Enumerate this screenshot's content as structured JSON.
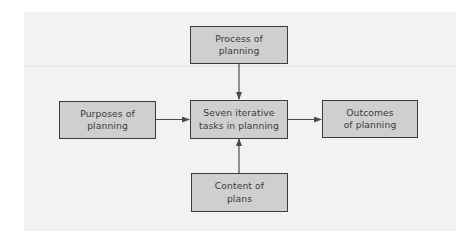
{
  "diagram": {
    "type": "flow",
    "nodes": [
      {
        "id": "process",
        "label": "Process of\nplanning"
      },
      {
        "id": "purposes",
        "label": "Purposes of\nplanning"
      },
      {
        "id": "center",
        "label": "Seven iterative\ntasks in planning"
      },
      {
        "id": "outcomes",
        "label": "Outcomes\nof planning"
      },
      {
        "id": "content",
        "label": "Content of\nplans"
      }
    ],
    "edges": [
      {
        "from": "process",
        "to": "center",
        "direction": "down"
      },
      {
        "from": "purposes",
        "to": "center",
        "direction": "right"
      },
      {
        "from": "center",
        "to": "outcomes",
        "direction": "right"
      },
      {
        "from": "content",
        "to": "center",
        "direction": "up"
      }
    ],
    "colors": {
      "box_fill": "#cfcfcf",
      "box_border": "#3c3c3c",
      "panel_background": "#f2f2f1",
      "text": "#3a3a3a",
      "arrow": "#4a4a4a"
    }
  }
}
